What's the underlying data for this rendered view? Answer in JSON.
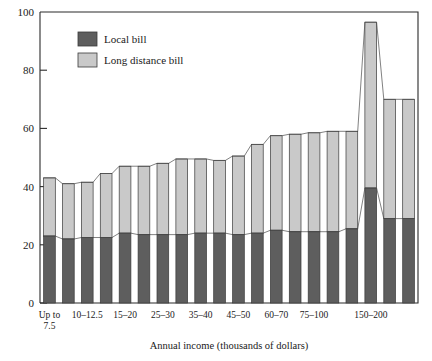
{
  "chart_data": {
    "type": "bar",
    "subtype": "stacked-bar",
    "title": "",
    "xlabel": "Annual income (thousands of dollars)",
    "ylabel": "",
    "ylim": [
      0,
      100
    ],
    "yticks": [
      0,
      20,
      40,
      60,
      80,
      100
    ],
    "grid": false,
    "legend_position": "top-left",
    "categories": [
      "Up to 7.5",
      "7.5-10",
      "10-12.5",
      "12.5-15",
      "15-20",
      "20-25",
      "25-30",
      "30-35",
      "35-40",
      "40-45",
      "45-50",
      "50-60",
      "60-70",
      "70-75",
      "75-100",
      "100-125",
      "125-150",
      "150-200",
      "200-250",
      "250 and over"
    ],
    "xtick_labels": [
      {
        "index": 0,
        "text": "Up to",
        "text2": "7.5"
      },
      {
        "index": 2,
        "text": "10–12.5",
        "text2": ""
      },
      {
        "index": 4,
        "text": "15–20",
        "text2": ""
      },
      {
        "index": 6,
        "text": "25–30",
        "text2": ""
      },
      {
        "index": 8,
        "text": "35–40",
        "text2": ""
      },
      {
        "index": 10,
        "text": "45–50",
        "text2": ""
      },
      {
        "index": 12,
        "text": "60–70",
        "text2": ""
      },
      {
        "index": 14,
        "text": "75–100",
        "text2": ""
      },
      {
        "index": 17,
        "text": "150–200",
        "text2": ""
      }
    ],
    "series": [
      {
        "name": "Local bill",
        "color": "#5e5e5e",
        "values": [
          23,
          22,
          22.5,
          22.5,
          24,
          23.5,
          23.5,
          23.5,
          24,
          24,
          23.5,
          24,
          25,
          24.5,
          24.5,
          24.5,
          25.5,
          39.5,
          29,
          29
        ]
      },
      {
        "name": "Long distance bill",
        "color": "#c9c9c9",
        "values": [
          20,
          19,
          19,
          22,
          23,
          23.5,
          24.5,
          26,
          25.5,
          25,
          27,
          30.5,
          32.5,
          33.5,
          34,
          34.5,
          33.5,
          57,
          41,
          41
        ]
      }
    ],
    "totals": [
      43,
      41,
      41.5,
      44.5,
      47,
      47,
      48,
      49.5,
      49.5,
      49,
      50.5,
      54.5,
      57.5,
      58,
      58.5,
      59,
      59,
      96.5,
      70,
      70
    ]
  },
  "legend": {
    "items": [
      {
        "label": "Local bill",
        "color": "#5e5e5e"
      },
      {
        "label": "Long distance bill",
        "color": "#c9c9c9"
      }
    ]
  },
  "axis": {
    "x_title": "Annual income (thousands of dollars)",
    "y_tick_texts": [
      "0",
      "20",
      "40",
      "60",
      "80",
      "100"
    ]
  }
}
